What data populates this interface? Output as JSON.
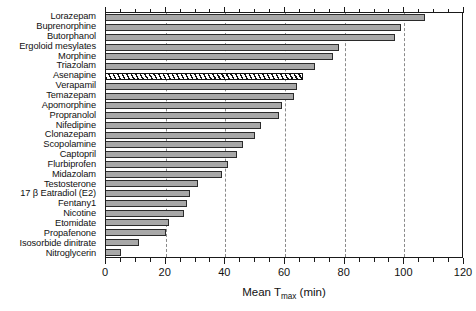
{
  "chart_data": {
    "type": "bar",
    "orientation": "horizontal",
    "title": "",
    "xlabel": "Mean T_max (min)",
    "xlabel_parts": {
      "pre": "Mean T",
      "sub": "max",
      "post": " (min)"
    },
    "ylabel": "",
    "xlim": [
      0,
      120
    ],
    "xticks": [
      0,
      20,
      40,
      60,
      80,
      100,
      120
    ],
    "xticklabels": [
      "0",
      "20",
      "40",
      "60",
      "80",
      "100",
      "120"
    ],
    "minor_tick_interval": 5,
    "grid": "vertical dashed gridlines at major ticks",
    "legend": "none",
    "categories": [
      "Lorazepam",
      "Buprenorphine",
      "Butorphanol",
      "Ergoloid mesylates",
      "Morphine",
      "Triazolam",
      "Asenapine",
      "Verapamil",
      "Temazepam",
      "Apomorphine",
      "Propranolol",
      "Nifedipine",
      "Clonazepam",
      "Scopolamine",
      "Captopril",
      "Flurbiprofen",
      "Midazolam",
      "Testosterone",
      "17 β Eatradiol (E2)",
      "Fentany1",
      "Nicotine",
      "Etomidate",
      "Propafenone",
      "Isosorbide dinitrate",
      "Nitroglycerin"
    ],
    "values": [
      107,
      99,
      97,
      78,
      76,
      70,
      66,
      64,
      63,
      59,
      58,
      52,
      50,
      46,
      44,
      41,
      39,
      31,
      28,
      27,
      26,
      21,
      20,
      11,
      5
    ],
    "highlight": {
      "category": "Asenapine",
      "style": "hatched diagonal fill",
      "index": 6
    },
    "bar_fill_color": "#a8a8a8",
    "bar_edge_color": "#2b2b2b",
    "gridline_color": "#8a8a8a",
    "background_color": "#ffffff",
    "text_color": "#111111"
  }
}
